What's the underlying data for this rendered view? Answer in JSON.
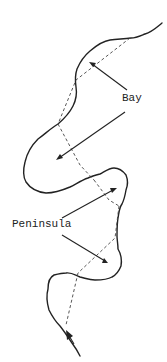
{
  "diagram": {
    "type": "coastline-features",
    "labels": {
      "bay": "Bay",
      "peninsula": "Peninsula"
    },
    "colors": {
      "background": "#ffffff",
      "line": "#222222",
      "dashed": "#444444"
    },
    "legend_note": "Solid line = coastline; dashed lines = chords across bays/peninsulas; arrows point from labels to features"
  }
}
